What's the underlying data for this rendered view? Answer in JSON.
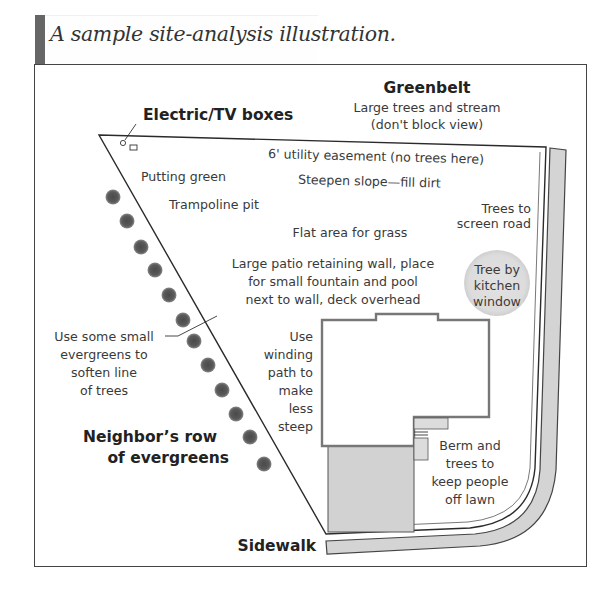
{
  "caption": "A sample site-analysis illustration.",
  "labels": {
    "greenbelt_title": "Greenbelt",
    "greenbelt_line1": "Large trees and stream",
    "greenbelt_line2": "(don't block view)",
    "electric": "Electric/TV boxes",
    "easement": "6' utility easement (no trees here)",
    "putting_green": "Putting green",
    "steepen_slope": "Steepen slope—fill dirt",
    "trampoline": "Trampoline pit",
    "trees_screen_1": "Trees to",
    "trees_screen_2": "screen road",
    "flat_area": "Flat area for grass",
    "patio_1": "Large patio retaining wall, place",
    "patio_2": "for small fountain and pool",
    "patio_3": "next to wall, deck overhead",
    "kitchen_1": "Tree by",
    "kitchen_2": "kitchen",
    "kitchen_3": "window",
    "small_evergreens_1": "Use some small",
    "small_evergreens_2": "evergreens to",
    "small_evergreens_3": "soften line",
    "small_evergreens_4": "of trees",
    "winding_1": "Use",
    "winding_2": "winding",
    "winding_3": "path to",
    "winding_4": "make",
    "winding_5": "less",
    "winding_6": "steep",
    "neighbor_1": "Neighbor’s row",
    "neighbor_2": "of evergreens",
    "berm_1": "Berm and",
    "berm_2": "trees to",
    "berm_3": "keep people",
    "berm_4": "off lawn",
    "sidewalk": "Sidewalk"
  },
  "colors": {
    "line": "#2a2a2a",
    "road_fill": "#d4d4d4",
    "driveway_fill": "#d2d2d2",
    "house_stroke": "#777777",
    "evergreen": "#555555",
    "tree_fill": "#dedede"
  }
}
